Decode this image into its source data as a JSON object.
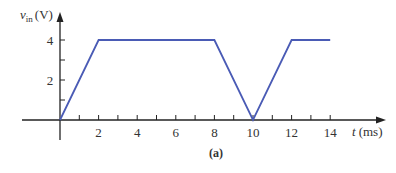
{
  "chart_data": {
    "type": "line",
    "title": "",
    "caption": "(a)",
    "ylabel": "v_in (V)",
    "ylabel_main": "v",
    "ylabel_sub": "in",
    "ylabel_unit": "(V)",
    "xlabel": "t (ms)",
    "xlabel_var": "t",
    "xlabel_unit": "(ms)",
    "x_ticks": [
      "2",
      "4",
      "6",
      "8",
      "10",
      "12",
      "14"
    ],
    "y_ticks": [
      "2",
      "4"
    ],
    "xlim": [
      0,
      15
    ],
    "ylim": [
      0,
      5
    ],
    "grid": false,
    "legend": null,
    "series": [
      {
        "name": "v_in",
        "color": "#4a5bb5",
        "x": [
          0,
          2,
          8,
          10,
          12,
          14
        ],
        "y": [
          0,
          4,
          4,
          0,
          4,
          4
        ]
      }
    ]
  },
  "colors": {
    "axis": "#222222",
    "line": "#4a5bb5",
    "text": "#333333"
  }
}
